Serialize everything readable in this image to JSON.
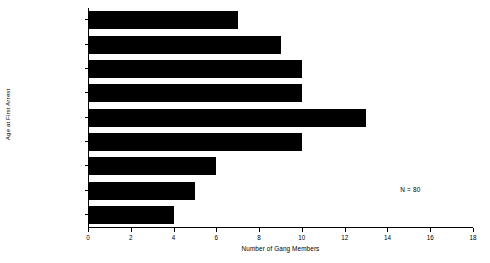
{
  "chart_data": {
    "type": "bar",
    "orientation": "horizontal",
    "title": "",
    "xlabel": "Number of Gang Members",
    "ylabel": "Age at First Arrest",
    "categories": [
      "Eleven and Under",
      "Twelve",
      "Thirteen",
      "Fourteen",
      "Fifteen",
      "Sixteen",
      "Seventeen",
      "Eighteen",
      "Nineteen and Over"
    ],
    "values": [
      7,
      9,
      10,
      10,
      13,
      10,
      6,
      5,
      4
    ],
    "xlim": [
      0,
      18
    ],
    "xticks": [
      0,
      2,
      4,
      6,
      8,
      10,
      12,
      14,
      16,
      18
    ],
    "xtick_labels": [
      "0",
      "2",
      "4",
      "6",
      "8",
      "10",
      "12",
      "14",
      "16",
      "18"
    ],
    "grid": false,
    "legend": false,
    "bar_color": "#000000",
    "background_color": "#ffffff",
    "annotations": [
      {
        "text": "N = 80",
        "x_value": 14.6,
        "y_category": "Eighteen"
      }
    ]
  }
}
